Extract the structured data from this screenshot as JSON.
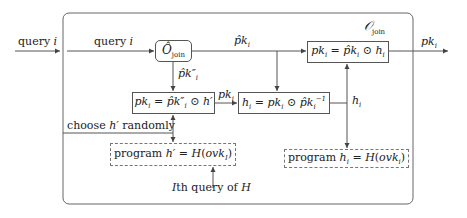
{
  "diagram": {
    "outer_container_label": "O_join",
    "external_input_label": "query i",
    "internal_input_label": "query i",
    "oracle_box": "Ô_join",
    "edge_oracle_to_top": "p̂k_i",
    "edge_oracle_down": "p̂k''_i",
    "box_top_right": "pk_i = p̂k_i ⊙ h_i",
    "output_label": "pk_i",
    "box_middle_left": "pk_i = p̂k''_i ⊙ h'",
    "edge_middle": "pk_i",
    "box_middle_right": "h_i = pk_i ⊙ p̂k_i^-1",
    "edge_h_i": "h_i",
    "choose_label": "choose h' randomly",
    "program_left": "program h' = H(ovk_I)",
    "program_right": "program h_i = H(ovk_i)",
    "query_of_H_label": "Ith query of H",
    "colors": {
      "line": "#555555",
      "dashed": "#777777",
      "text": "#222222"
    }
  }
}
